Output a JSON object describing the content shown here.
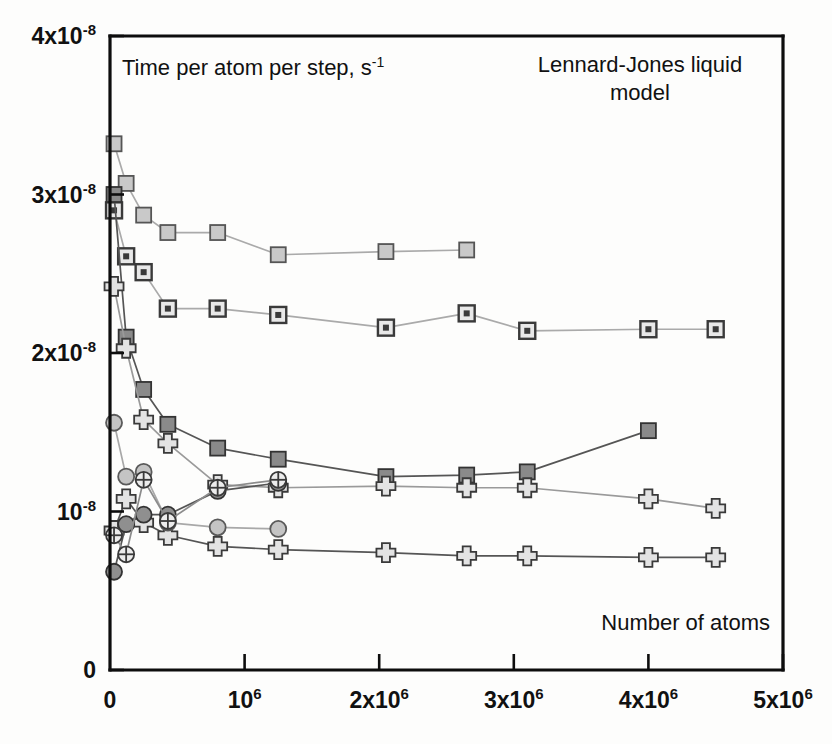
{
  "figure": {
    "background_color": "#fdfdfc",
    "axis_color": "#0d0d0d"
  },
  "labels": {
    "y_axis_title_main": "Time per atom per step, s",
    "y_axis_title_sup": "-1",
    "plot_title_line1": "Lennard-Jones liquid",
    "plot_title_line2": "model",
    "x_axis_title": "Number of atoms"
  },
  "y_ticks": [
    {
      "value": 0,
      "base": "0",
      "sup": ""
    },
    {
      "value": 1e-08,
      "base": "10",
      "sup": "-8"
    },
    {
      "value": 2e-08,
      "base": "2x10",
      "sup": "-8"
    },
    {
      "value": 3e-08,
      "base": "3x10",
      "sup": "-8"
    },
    {
      "value": 4e-08,
      "base": "4x10",
      "sup": "-8"
    }
  ],
  "x_ticks": [
    {
      "value": 0,
      "base": "0",
      "sup": ""
    },
    {
      "value": 1000000,
      "base": "10",
      "sup": "6"
    },
    {
      "value": 2000000,
      "base": "2x10",
      "sup": "6"
    },
    {
      "value": 3000000,
      "base": "3x10",
      "sup": "6"
    },
    {
      "value": 4000000,
      "base": "4x10",
      "sup": "6"
    },
    {
      "value": 5000000,
      "base": "5x10",
      "sup": "6"
    }
  ],
  "chart_data": {
    "type": "line",
    "title": "Lennard-Jones liquid model",
    "xlabel": "Number of atoms",
    "ylabel": "Time per atom per step, s^-1",
    "xlim": [
      0,
      5000000
    ],
    "ylim": [
      0,
      4e-08
    ],
    "grid": false,
    "legend": "none",
    "series": [
      {
        "name": "light-square-series",
        "marker": "square-light",
        "marker_fill": "#c9c9c9",
        "marker_stroke": "#555555",
        "line_color": "#aaaaaa",
        "line_style": "solid",
        "x": [
          30000,
          120000,
          250000,
          430000,
          800000,
          1250000,
          2050000,
          2650000
        ],
        "y": [
          3.32e-08,
          3.07e-08,
          2.87e-08,
          2.76e-08,
          2.76e-08,
          2.62e-08,
          2.64e-08,
          2.65e-08
        ]
      },
      {
        "name": "dotted-square-series",
        "marker": "square-dotted",
        "marker_fill": "#e8e8e8",
        "marker_stroke": "#3a3a3a",
        "line_color": "#aaaaaa",
        "line_style": "solid",
        "x": [
          30000,
          120000,
          250000,
          430000,
          800000,
          1250000,
          2050000,
          2650000,
          3100000,
          4000000,
          4500000
        ],
        "y": [
          2.9e-08,
          2.61e-08,
          2.51e-08,
          2.28e-08,
          2.28e-08,
          2.24e-08,
          2.16e-08,
          2.25e-08,
          2.14e-08,
          2.15e-08,
          2.15e-08
        ]
      },
      {
        "name": "dark-square-series",
        "marker": "square-dark",
        "marker_fill": "#8a8a8a",
        "marker_stroke": "#333333",
        "line_color": "#555555",
        "line_style": "solid",
        "x": [
          30000,
          120000,
          250000,
          430000,
          800000,
          1250000,
          2050000,
          2650000,
          3100000,
          4000000
        ],
        "y": [
          3e-08,
          2.1e-08,
          1.77e-08,
          1.55e-08,
          1.4e-08,
          1.33e-08,
          1.22e-08,
          1.23e-08,
          1.25e-08,
          1.51e-08
        ]
      },
      {
        "name": "upper-cross-series",
        "marker": "cross",
        "marker_fill": "#e3e3e3",
        "marker_stroke": "#3a3a3a",
        "line_color": "#9a9a9a",
        "line_style": "solid",
        "x": [
          30000,
          120000,
          250000,
          430000,
          800000,
          1250000,
          2050000,
          2650000,
          3100000,
          4000000,
          4500000
        ],
        "y": [
          2.42e-08,
          2.03e-08,
          1.58e-08,
          1.43e-08,
          1.17e-08,
          1.15e-08,
          1.16e-08,
          1.15e-08,
          1.15e-08,
          1.08e-08,
          1.02e-08
        ]
      },
      {
        "name": "lower-cross-series",
        "marker": "cross",
        "marker_fill": "#e3e3e3",
        "marker_stroke": "#3a3a3a",
        "line_color": "#555555",
        "line_style": "solid",
        "x": [
          30000,
          120000,
          250000,
          430000,
          800000,
          1250000,
          2050000,
          2650000,
          3100000,
          4000000,
          4500000
        ],
        "y": [
          8.8e-09,
          1.08e-08,
          9.3e-09,
          8.5e-09,
          7.8e-09,
          7.6e-09,
          7.4e-09,
          7.2e-09,
          7.2e-09,
          7.1e-09,
          7.1e-09
        ]
      },
      {
        "name": "light-circle-series",
        "marker": "circle-light",
        "marker_fill": "#c4c4c4",
        "marker_stroke": "#5a5a5a",
        "line_color": "#a8a8a8",
        "line_style": "solid",
        "x": [
          30000,
          120000,
          250000,
          430000,
          800000,
          1250000
        ],
        "y": [
          1.56e-08,
          1.22e-08,
          1.25e-08,
          9.3e-09,
          9e-09,
          8.9e-09
        ]
      },
      {
        "name": "dark-circle-series",
        "marker": "circle-dark",
        "marker_fill": "#8f8f8f",
        "marker_stroke": "#333333",
        "line_color": "#555555",
        "line_style": "solid",
        "x": [
          30000,
          120000,
          250000,
          430000,
          800000,
          1250000
        ],
        "y": [
          6.2e-09,
          9.2e-09,
          9.8e-09,
          9.8e-09,
          1.13e-08,
          1.18e-08
        ]
      },
      {
        "name": "crossed-circle-series",
        "marker": "circle-crossed",
        "marker_fill": "#ececec",
        "marker_stroke": "#3a3a3a",
        "line_color": "#8c8c8c",
        "line_style": "solid",
        "x": [
          30000,
          120000,
          250000,
          430000,
          800000,
          1250000
        ],
        "y": [
          8.5e-09,
          7.3e-09,
          1.2e-08,
          9.4e-09,
          1.15e-08,
          1.2e-08
        ]
      }
    ]
  }
}
